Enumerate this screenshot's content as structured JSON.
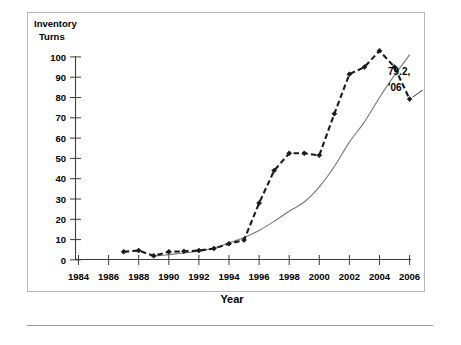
{
  "chart_data": {
    "type": "line",
    "title": "",
    "ylabel_line1": "Inventory",
    "ylabel_line2": "Turns",
    "xlabel": "Year",
    "grid": false,
    "legend_position": "none",
    "xlim": [
      1984,
      2006
    ],
    "ylim": [
      0,
      100
    ],
    "ytick_labels": [
      "100",
      "90",
      "80",
      "70",
      "60",
      "50",
      "40",
      "30",
      "20",
      "10",
      "0"
    ],
    "ytick_values": [
      100,
      90,
      80,
      70,
      60,
      50,
      40,
      30,
      20,
      10,
      0
    ],
    "xtick_labels": [
      "1984",
      "1986",
      "1988",
      "1990",
      "1992",
      "1994",
      "1996",
      "1998",
      "2000",
      "2002",
      "2004",
      "2006"
    ],
    "xtick_values": [
      1984,
      1986,
      1988,
      1990,
      1992,
      1994,
      1996,
      1998,
      2000,
      2002,
      2004,
      2006
    ],
    "series": [
      {
        "name": "dashed-marker-series",
        "style": "dashed",
        "marker": "diamond",
        "color": "#1a1a1a",
        "x": [
          1987,
          1988,
          1989,
          1990,
          1991,
          1992,
          1993,
          1994,
          1995,
          1996,
          1997,
          1998,
          1999,
          2000,
          2001,
          2002,
          2003,
          2004,
          2005,
          2006
        ],
        "values": [
          4.0,
          4.6,
          2.0,
          4.0,
          4.2,
          4.6,
          5.6,
          8.0,
          9.8,
          28.0,
          44.0,
          52.5,
          52.5,
          51.5,
          72.0,
          91.5,
          95.0,
          103.0,
          95.0,
          79.2
        ]
      },
      {
        "name": "thin-solid-series",
        "style": "solid",
        "marker": "none",
        "color": "#777777",
        "x": [
          1989,
          1990,
          1991,
          1992,
          1993,
          1994,
          1995,
          1996,
          1997,
          1998,
          1999,
          2000,
          2001,
          2002,
          2003,
          2004,
          2005,
          2006
        ],
        "values": [
          1.8,
          2.6,
          3.4,
          4.4,
          5.8,
          8.4,
          11.0,
          14.5,
          19.0,
          24.0,
          28.5,
          36.0,
          46.0,
          58.0,
          68.0,
          80.0,
          91.0,
          101.0
        ]
      }
    ],
    "annotations": [
      {
        "name": "final-value-annotation",
        "line1": "79.2,",
        "line2": "'06",
        "x": 2006,
        "y": 79.2
      }
    ]
  }
}
